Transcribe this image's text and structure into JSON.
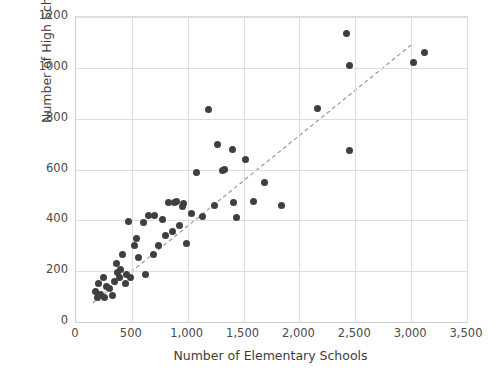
{
  "chart_data": {
    "type": "scatter",
    "title": "",
    "xlabel": "Number of Elementary Schools",
    "ylabel": "Number of High Schools",
    "xlim": [
      0,
      3500
    ],
    "ylim": [
      0,
      1200
    ],
    "xticks": [
      "0",
      "500",
      "1,000",
      "1,500",
      "2,000",
      "2,500",
      "3,000",
      "3,500"
    ],
    "xtick_values": [
      0,
      500,
      1000,
      1500,
      2000,
      2500,
      3000,
      3500
    ],
    "yticks": [
      "0",
      "200",
      "400",
      "600",
      "800",
      "1000",
      "1200"
    ],
    "ytick_values": [
      0,
      200,
      400,
      600,
      800,
      1000,
      1200
    ],
    "grid": true,
    "legend": false,
    "marker_color": "#3f3f3f",
    "trendline": {
      "style": "dashed",
      "color": "#9a9a9a",
      "x": [
        150,
        3000
      ],
      "y": [
        75,
        1090
      ]
    },
    "points": [
      [
        175,
        120
      ],
      [
        190,
        95
      ],
      [
        205,
        150
      ],
      [
        215,
        110
      ],
      [
        250,
        175
      ],
      [
        255,
        95
      ],
      [
        275,
        140
      ],
      [
        300,
        130
      ],
      [
        330,
        105
      ],
      [
        345,
        160
      ],
      [
        360,
        230
      ],
      [
        370,
        195
      ],
      [
        385,
        175
      ],
      [
        400,
        205
      ],
      [
        420,
        265
      ],
      [
        440,
        150
      ],
      [
        450,
        185
      ],
      [
        470,
        395
      ],
      [
        490,
        175
      ],
      [
        520,
        300
      ],
      [
        545,
        330
      ],
      [
        560,
        255
      ],
      [
        600,
        390
      ],
      [
        620,
        185
      ],
      [
        650,
        420
      ],
      [
        690,
        265
      ],
      [
        700,
        420
      ],
      [
        740,
        300
      ],
      [
        770,
        405
      ],
      [
        800,
        340
      ],
      [
        830,
        470
      ],
      [
        860,
        355
      ],
      [
        880,
        470
      ],
      [
        900,
        475
      ],
      [
        930,
        380
      ],
      [
        950,
        455
      ],
      [
        960,
        465
      ],
      [
        990,
        310
      ],
      [
        1030,
        425
      ],
      [
        1080,
        590
      ],
      [
        1130,
        415
      ],
      [
        1190,
        835
      ],
      [
        1240,
        460
      ],
      [
        1270,
        700
      ],
      [
        1310,
        595
      ],
      [
        1330,
        600
      ],
      [
        1400,
        680
      ],
      [
        1410,
        470
      ],
      [
        1440,
        410
      ],
      [
        1520,
        640
      ],
      [
        1590,
        475
      ],
      [
        1690,
        550
      ],
      [
        1840,
        460
      ],
      [
        2160,
        840
      ],
      [
        2420,
        1135
      ],
      [
        2450,
        1010
      ],
      [
        2450,
        675
      ],
      [
        3020,
        1020
      ],
      [
        3120,
        1060
      ]
    ]
  }
}
